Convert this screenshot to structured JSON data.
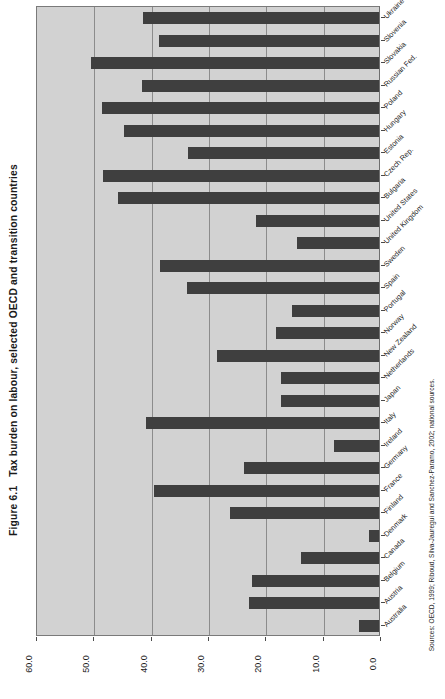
{
  "figure": {
    "number": "Figure 6.1",
    "title": "Tax burden on labour, selected OECD and transition countries",
    "source": "Sources: OECD, 1999; Riboud, Silva-Jauregui and Sanchez-Paramo, 2002; national sources."
  },
  "axis": {
    "tick_labels": [
      "60.0",
      "50.0",
      "40.0",
      "30.0",
      "20.0",
      "10.0",
      "0.0"
    ],
    "min": 0.0,
    "max": 60.0
  },
  "colors": {
    "bar": "#3f3f3f",
    "plot_background": "#d2d2d2",
    "gridline": "#8c8c8c",
    "axis": "#4a4a4a",
    "text": "#1a1a1a"
  },
  "chart_data": {
    "type": "bar",
    "orientation": "horizontal",
    "xlabel": "",
    "ylabel": "",
    "xlim": [
      0.0,
      60.0
    ],
    "grid": true,
    "legend": "none",
    "note": "Value axis is reversed: 0.0 at right edge, 60.0 at left edge. Categories listed top-to-bottom as rendered.",
    "categories": [
      "Ukraine",
      "Slovenia",
      "Slovakia",
      "Russian Fed.",
      "Poland",
      "Hungary",
      "Estonia",
      "Czech Rep.",
      "Bulgaria",
      "United States",
      "United Kingdom",
      "Sweden",
      "Spain",
      "Portugal",
      "Norway",
      "New Zealand",
      "Netherlands",
      "Japan",
      "Italy",
      "Ireland",
      "Germany",
      "France",
      "Finland",
      "Denmark",
      "Canada",
      "Belgium",
      "Austria",
      "Australia"
    ],
    "values": [
      41.1,
      38.3,
      50.2,
      41.3,
      48.4,
      44.4,
      33.4,
      48.1,
      45.5,
      21.4,
      14.3,
      38.2,
      33.5,
      15.1,
      17.9,
      28.2,
      17.1,
      17.1,
      40.6,
      7.8,
      23.5,
      39.2,
      26.0,
      1.7,
      13.6,
      22.1,
      22.6,
      3.5
    ]
  }
}
